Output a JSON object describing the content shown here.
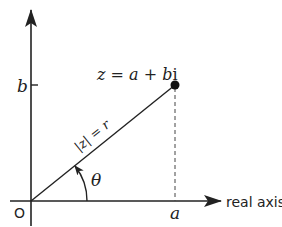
{
  "diagram": {
    "type": "complex-plane-polar-form",
    "origin_label": "O",
    "real_axis_label": "real axis",
    "point_label": {
      "lhs": "z",
      "eq": " = ",
      "a": "a",
      "plus": " + ",
      "b": "b",
      "i": "i"
    },
    "modulus_label": "|z| = r",
    "angle_label": "θ",
    "x_tick_label": "a",
    "y_tick_label": "b",
    "colors": {
      "stroke": "#222222",
      "background": "#ffffff"
    }
  }
}
